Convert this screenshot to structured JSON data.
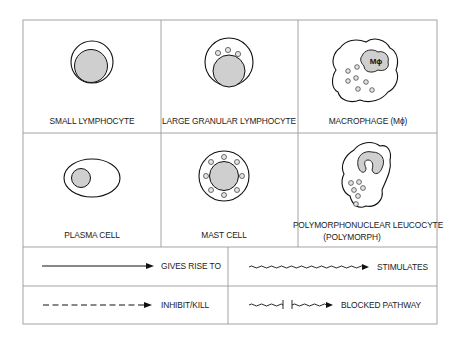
{
  "colors": {
    "border": "#9a9a9a",
    "line": "#111111",
    "fill": "#cfcfcf",
    "background": "#ffffff"
  },
  "cells": [
    {
      "id": "small-lymphocyte",
      "label": "SMALL LYMPHOCYTE"
    },
    {
      "id": "large-granular-lymphocyte",
      "label": "LARGE GRANULAR LYMPHOCYTE"
    },
    {
      "id": "macrophage",
      "label": "MACROPHAGE (Mϕ)",
      "nucleus_label": "Mϕ"
    },
    {
      "id": "plasma-cell",
      "label": "PLASMA CELL"
    },
    {
      "id": "mast-cell",
      "label": "MAST CELL"
    },
    {
      "id": "polymorph",
      "label": "POLYMORPHONUCLEAR LEUCOCYTE",
      "label_line2": "(POLYMORPH)"
    }
  ],
  "legend": [
    {
      "id": "gives-rise-to",
      "style": "solid-arrow",
      "label": "GIVES RISE TO"
    },
    {
      "id": "stimulates",
      "style": "wavy-arrow",
      "label": "STIMULATES"
    },
    {
      "id": "inhibit-kill",
      "style": "dashed-arrow",
      "label": "INHIBIT/KILL"
    },
    {
      "id": "blocked-pathway",
      "style": "blocked-wavy-arrow",
      "label": "BLOCKED PATHWAY"
    }
  ]
}
